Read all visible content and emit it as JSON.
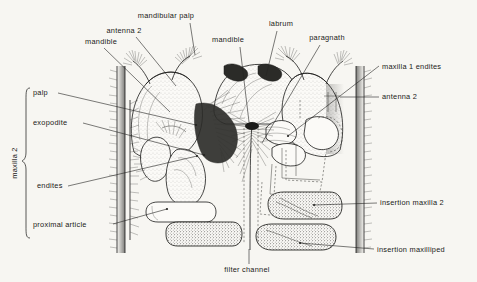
{
  "figure": {
    "background_color": "#f7f6f2",
    "ink_color": "#1b1b19"
  },
  "group_labels": [
    {
      "name": "maxilla-2-group",
      "text": "maxilla 2",
      "orientation": "vertical"
    }
  ],
  "labels": [
    {
      "id": "mandibular-palp",
      "text": "mandibular palp",
      "x": 166,
      "y": 18,
      "anchor": "middle"
    },
    {
      "id": "antenna-2-top",
      "text": "antenna 2",
      "x": 124,
      "y": 33,
      "anchor": "middle"
    },
    {
      "id": "mandible-left",
      "text": "mandible",
      "x": 101,
      "y": 44,
      "anchor": "middle"
    },
    {
      "id": "mandible-right",
      "text": "mandible",
      "x": 228,
      "y": 42,
      "anchor": "middle"
    },
    {
      "id": "labrum",
      "text": "labrum",
      "x": 281,
      "y": 26,
      "anchor": "middle"
    },
    {
      "id": "paragnath",
      "text": "paragnath",
      "x": 327,
      "y": 40,
      "anchor": "middle"
    },
    {
      "id": "maxilla-1-endites",
      "text": "maxilla 1 endites",
      "x": 382,
      "y": 69,
      "anchor": "start"
    },
    {
      "id": "antenna-2-right",
      "text": "antenna 2",
      "x": 382,
      "y": 99,
      "anchor": "start"
    },
    {
      "id": "palp",
      "text": "palp",
      "x": 33,
      "y": 95,
      "anchor": "start"
    },
    {
      "id": "exopodite",
      "text": "exopodite",
      "x": 33,
      "y": 125,
      "anchor": "start"
    },
    {
      "id": "endites",
      "text": "endites",
      "x": 37,
      "y": 188,
      "anchor": "start"
    },
    {
      "id": "proximal-article",
      "text": "proximal  article",
      "x": 33,
      "y": 227,
      "anchor": "start"
    },
    {
      "id": "insertion-maxilla-2",
      "text": "insertion maxilla 2",
      "x": 380,
      "y": 205,
      "anchor": "start"
    },
    {
      "id": "insertion-maxilliped",
      "text": "insertion maxilliped",
      "x": 377,
      "y": 252,
      "anchor": "start"
    },
    {
      "id": "filter-channel",
      "text": "filter  channel",
      "x": 247,
      "y": 272,
      "anchor": "middle"
    }
  ]
}
